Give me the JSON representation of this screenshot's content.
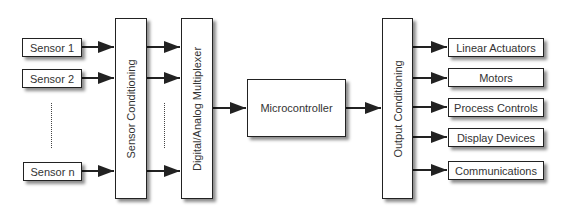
{
  "inputs": [
    "Sensor 1",
    "Sensor 2",
    "Sensor n"
  ],
  "stages": {
    "sensor_conditioning": "Sensor Conditioning",
    "multiplexer": "Digital/Analog Multiplexer",
    "microcontroller": "Microcontroller",
    "output_conditioning": "Output Conditioning"
  },
  "outputs": [
    "Linear Actuators",
    "Motors",
    "Process Controls",
    "Display Devices",
    "Communications"
  ]
}
